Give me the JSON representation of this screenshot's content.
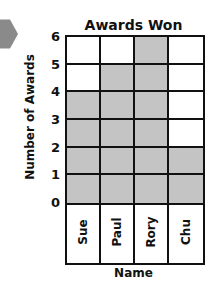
{
  "chart_data": {
    "type": "bar",
    "title": "Awards Won",
    "xlabel": "Name",
    "ylabel": "Number of Awards",
    "categories": [
      "Sue",
      "Paul",
      "Rory",
      "Chu"
    ],
    "values": [
      4,
      5,
      6,
      2
    ],
    "ylim": [
      0,
      6
    ],
    "yticks": [
      "0",
      "1",
      "2",
      "3",
      "4",
      "5",
      "6"
    ],
    "grid": true,
    "bar_color": "#c4c4c4"
  },
  "decor": {
    "corner_icon": "hexagon-icon"
  }
}
